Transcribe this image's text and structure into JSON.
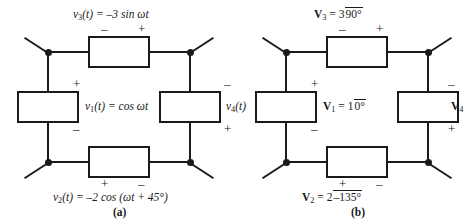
{
  "figure": {
    "title": "",
    "panels": [
      {
        "id": "a",
        "caption": "(a)",
        "domain": "time-domain",
        "elements": [
          {
            "name": "v3",
            "position": "top",
            "label_html": "v<sub>3</sub>(t) = –3 sin ωt",
            "label_text": "v3(t) = -3 sin wt",
            "polarity_left": "–",
            "polarity_right": "+"
          },
          {
            "name": "v1",
            "position": "left",
            "label_html": "v<sub>1</sub>(t) = cos ωt",
            "label_text": "v1(t) = cos wt",
            "polarity_top": "+",
            "polarity_bottom": "–"
          },
          {
            "name": "v4",
            "position": "right",
            "label_html": "v<sub>4</sub>(t)",
            "label_text": "v4(t)",
            "polarity_top": "–",
            "polarity_bottom": "+"
          },
          {
            "name": "v2",
            "position": "bottom",
            "label_html": "v<sub>2</sub>(t) = –2 cos (ωt + 45°)",
            "label_text": "v2(t) = -2 cos (wt + 45deg)",
            "polarity_left": "+",
            "polarity_right": "–"
          }
        ]
      },
      {
        "id": "b",
        "caption": "(b)",
        "domain": "phasor-domain",
        "elements": [
          {
            "name": "V3",
            "position": "top",
            "label_html": "V<sub>3</sub> = 3 ∠ 90°",
            "label_text": "V3 = 3 angle 90deg",
            "magnitude": 3,
            "angle_deg": 90,
            "polarity_left": "–",
            "polarity_right": "+"
          },
          {
            "name": "V1",
            "position": "left",
            "label_html": "V<sub>1</sub> = 1 ∠ 0°",
            "label_text": "V1 = 1 angle 0deg",
            "magnitude": 1,
            "angle_deg": 0,
            "polarity_top": "+",
            "polarity_bottom": "–"
          },
          {
            "name": "V4",
            "position": "right",
            "label_html": "V<sub>4</sub>",
            "label_text": "V4",
            "polarity_top": "–",
            "polarity_bottom": "+"
          },
          {
            "name": "V2",
            "position": "bottom",
            "label_html": "V<sub>2</sub> = 2 ∠ –135°",
            "label_text": "V2 = 2 angle -135deg",
            "magnitude": 2,
            "angle_deg": -135,
            "polarity_left": "+",
            "polarity_right": "–"
          }
        ]
      }
    ]
  },
  "panel_a": {
    "caption": "(a)",
    "top_label_parts": {
      "var": "v",
      "sub": "3",
      "rest": "(t) = –3 sin ωt"
    },
    "left_label_parts": {
      "var": "v",
      "sub": "1",
      "rest": "(t) = cos ωt"
    },
    "right_label_parts": {
      "var": "v",
      "sub": "4",
      "rest": "(t)"
    },
    "bottom_label_parts": {
      "var": "v",
      "sub": "2",
      "rest": "(t) = –2 cos (ωt + 45°)"
    },
    "sign_top_left": "–",
    "sign_top_right": "+",
    "sign_left_top": "+",
    "sign_left_bottom": "–",
    "sign_right_top": "–",
    "sign_right_bottom": "+",
    "sign_bottom_left": "+",
    "sign_bottom_right": "–"
  },
  "panel_b": {
    "caption": "(b)",
    "top_label_parts": {
      "var": "V",
      "sub": "3",
      "eq": " = 3",
      "mag": "3",
      "ang": "90°"
    },
    "left_label_parts": {
      "var": "V",
      "sub": "1",
      "eq": " = 1",
      "mag": "1",
      "ang": "0°"
    },
    "right_label_parts": {
      "var": "V",
      "sub": "4",
      "eq": "",
      "mag": "",
      "ang": ""
    },
    "bottom_label_parts": {
      "var": "V",
      "sub": "2",
      "eq": " = 2",
      "mag": "2",
      "ang": "–135°"
    },
    "sign_top_left": "–",
    "sign_top_right": "+",
    "sign_left_top": "+",
    "sign_left_bottom": "–",
    "sign_right_top": "–",
    "sign_right_bottom": "+",
    "sign_bottom_left": "+",
    "sign_bottom_right": "–"
  },
  "colors": {
    "ink": "#1a1a1a",
    "background": "#ffffff"
  }
}
